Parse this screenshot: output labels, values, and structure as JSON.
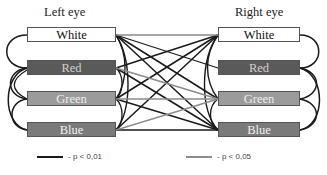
{
  "titles": {
    "left": "Left eye",
    "right": "Right eye"
  },
  "nodes": [
    {
      "label": "White",
      "fill": "#ffffff",
      "text_color": "#111111"
    },
    {
      "label": "Red",
      "fill": "#5a5a5a",
      "text_color": "#cfcfcf"
    },
    {
      "label": "Green",
      "fill": "#9b9b9b",
      "text_color": "#eeeeee"
    },
    {
      "label": "Blue",
      "fill": "#7a7a7a",
      "text_color": "#f2f2f2"
    }
  ],
  "legend": [
    {
      "label": "- p < 0,01",
      "color": "#1a1a1a"
    },
    {
      "label": "- p < 0,05",
      "color": "#8c8c8c"
    }
  ],
  "diagram": {
    "type": "correlation-network",
    "edge_classes": {
      "strong": "p < 0,01",
      "weak": "p < 0,05"
    }
  }
}
